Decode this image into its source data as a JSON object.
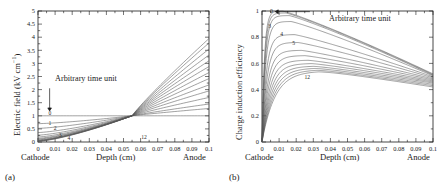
{
  "figure": {
    "background": "#ffffff",
    "curve_color": "#555555"
  },
  "panels": [
    {
      "id": "a",
      "caption": "(a)",
      "ylabel_main": "Electric field (kV cm",
      "ylabel_sup": "−1",
      "ylabel_tail": ")",
      "xlabel": "Depth (cm)",
      "left_electrode": "Cathode",
      "right_electrode": "Anode",
      "annotation": "Arbitrary time unit",
      "curve_tags": [
        "0",
        "1",
        "2",
        "3",
        "4",
        "12"
      ]
    },
    {
      "id": "b",
      "caption": "(b)",
      "ylabel_main": "Charge induction efficiency",
      "ylabel_sup": "",
      "ylabel_tail": "",
      "xlabel": "Depth (cm)",
      "left_electrode": "Cathode",
      "right_electrode": "Anode",
      "annotation": "Arbitrary time unit",
      "curve_tags": [
        "0",
        "3",
        "4",
        "5",
        "12"
      ]
    }
  ],
  "chart_data": [
    {
      "type": "line",
      "panel": "a",
      "title": "",
      "xlabel": "Depth (cm)",
      "ylabel": "Electric field (kV cm−1)",
      "xlim": [
        0,
        0.1
      ],
      "ylim": [
        0,
        5
      ],
      "xticks": [
        0,
        0.01,
        0.02,
        0.03,
        0.04,
        0.05,
        0.06,
        0.07,
        0.08,
        0.09,
        0.1
      ],
      "xticklabels": [
        "0",
        "0.01",
        "0.02",
        "0.03",
        "0.04",
        "0.05",
        "0.06",
        "0.07",
        "0.08",
        "0.09",
        "0.1"
      ],
      "yticks": [
        0,
        0.5,
        1,
        1.5,
        2,
        2.5,
        3,
        3.5,
        4,
        4.5,
        5
      ],
      "yticklabels": [
        "0",
        "0.5",
        "1",
        "1.5",
        "2",
        "2.5",
        "3",
        "3.5",
        "4",
        "4.5",
        "5"
      ],
      "grid": false,
      "legend": "none",
      "annotations": [
        {
          "text": "Arbitrary time unit",
          "x": 0.012,
          "y": 2.3
        },
        {
          "text": "0",
          "x": 0.007,
          "y": 1.12
        },
        {
          "text": "1",
          "x": 0.007,
          "y": 0.72
        },
        {
          "text": "2",
          "x": 0.01,
          "y": 0.52
        },
        {
          "text": "3",
          "x": 0.013,
          "y": 0.26
        },
        {
          "text": "4",
          "x": 0.018,
          "y": 0.16
        },
        {
          "text": "12",
          "x": 0.062,
          "y": 0.18
        }
      ],
      "pinch_point": {
        "x": 0.055,
        "y": 1.0
      },
      "series": [
        {
          "name": "0",
          "x": [
            0,
            0.1
          ],
          "values": [
            1.0,
            1.0
          ]
        },
        {
          "name": "1",
          "x": [
            0,
            0.055,
            0.1
          ],
          "values": [
            0.7,
            1.0,
            1.28
          ]
        },
        {
          "name": "2",
          "x": [
            0,
            0.055,
            0.1
          ],
          "values": [
            0.52,
            1.0,
            1.45
          ]
        },
        {
          "name": "3",
          "x": [
            0,
            0.055,
            0.1
          ],
          "values": [
            0.36,
            1.0,
            1.7
          ]
        },
        {
          "name": "4",
          "x": [
            0,
            0.055,
            0.1
          ],
          "values": [
            0.26,
            1.0,
            1.95
          ]
        },
        {
          "name": "5",
          "x": [
            0,
            0.055,
            0.1
          ],
          "values": [
            0.19,
            1.0,
            2.18
          ]
        },
        {
          "name": "6",
          "x": [
            0,
            0.055,
            0.1
          ],
          "values": [
            0.14,
            1.0,
            2.42
          ]
        },
        {
          "name": "7",
          "x": [
            0,
            0.055,
            0.1
          ],
          "values": [
            0.11,
            1.0,
            2.65
          ]
        },
        {
          "name": "8",
          "x": [
            0,
            0.055,
            0.1
          ],
          "values": [
            0.08,
            1.0,
            2.88
          ]
        },
        {
          "name": "9",
          "x": [
            0,
            0.055,
            0.1
          ],
          "values": [
            0.06,
            1.0,
            3.1
          ]
        },
        {
          "name": "10",
          "x": [
            0,
            0.055,
            0.1
          ],
          "values": [
            0.05,
            1.0,
            3.32
          ]
        },
        {
          "name": "11",
          "x": [
            0,
            0.055,
            0.1
          ],
          "values": [
            0.04,
            1.0,
            3.55
          ]
        },
        {
          "name": "12",
          "x": [
            0,
            0.055,
            0.1
          ],
          "values": [
            0.03,
            1.0,
            3.78
          ]
        },
        {
          "name": "13",
          "x": [
            0,
            0.055,
            0.1
          ],
          "values": [
            0.02,
            1.0,
            3.95
          ]
        }
      ]
    },
    {
      "type": "line",
      "panel": "b",
      "title": "",
      "xlabel": "Depth (cm)",
      "ylabel": "Charge induction efficiency",
      "xlim": [
        0,
        0.1
      ],
      "ylim": [
        0,
        1
      ],
      "xticks": [
        0,
        0.01,
        0.02,
        0.03,
        0.04,
        0.05,
        0.06,
        0.07,
        0.08,
        0.09,
        0.1
      ],
      "xticklabels": [
        "0",
        "0.01",
        "0.02",
        "0.03",
        "0.04",
        "0.05",
        "0.06",
        "0.07",
        "0.08",
        "0.09",
        "0.1"
      ],
      "yticks": [
        0,
        0.2,
        0.4,
        0.6,
        0.8,
        1
      ],
      "yticklabels": [
        "0",
        "0.2",
        "0.4",
        "0.6",
        "0.8",
        "1"
      ],
      "grid": false,
      "legend": "none",
      "annotations": [
        {
          "text": "Arbitrary time unit",
          "x": 0.03,
          "y": 0.99
        },
        {
          "text": "0",
          "x": 0.0055,
          "y": 1.0
        },
        {
          "text": "3",
          "x": 0.0045,
          "y": 0.885
        },
        {
          "text": "4",
          "x": 0.0115,
          "y": 0.825
        },
        {
          "text": "5",
          "x": 0.0185,
          "y": 0.755
        },
        {
          "text": "12",
          "x": 0.0265,
          "y": 0.495
        }
      ],
      "series": [
        {
          "name": "0",
          "peak": 1.0,
          "peak_x": 0.012,
          "anode_value": 0.52,
          "rise_k": 700
        },
        {
          "name": "1",
          "peak": 0.985,
          "peak_x": 0.014,
          "anode_value": 0.515,
          "rise_k": 620
        },
        {
          "name": "2",
          "peak": 0.965,
          "peak_x": 0.016,
          "anode_value": 0.51,
          "rise_k": 540
        },
        {
          "name": "3",
          "peak": 0.92,
          "peak_x": 0.017,
          "anode_value": 0.505,
          "rise_k": 470
        },
        {
          "name": "4",
          "peak": 0.82,
          "peak_x": 0.019,
          "anode_value": 0.498,
          "rise_k": 400
        },
        {
          "name": "5",
          "peak": 0.76,
          "peak_x": 0.021,
          "anode_value": 0.49,
          "rise_k": 345
        },
        {
          "name": "6",
          "peak": 0.7,
          "peak_x": 0.023,
          "anode_value": 0.482,
          "rise_k": 300
        },
        {
          "name": "7",
          "peak": 0.66,
          "peak_x": 0.025,
          "anode_value": 0.474,
          "rise_k": 262
        },
        {
          "name": "8",
          "peak": 0.625,
          "peak_x": 0.027,
          "anode_value": 0.466,
          "rise_k": 230
        },
        {
          "name": "9",
          "peak": 0.6,
          "peak_x": 0.029,
          "anode_value": 0.458,
          "rise_k": 204
        },
        {
          "name": "10",
          "peak": 0.58,
          "peak_x": 0.03,
          "anode_value": 0.45,
          "rise_k": 182
        },
        {
          "name": "11",
          "peak": 0.565,
          "peak_x": 0.031,
          "anode_value": 0.44,
          "rise_k": 163
        },
        {
          "name": "12",
          "peak": 0.552,
          "peak_x": 0.032,
          "anode_value": 0.43,
          "rise_k": 147
        },
        {
          "name": "13",
          "peak": 0.542,
          "peak_x": 0.033,
          "anode_value": 0.42,
          "rise_k": 133
        }
      ]
    }
  ]
}
